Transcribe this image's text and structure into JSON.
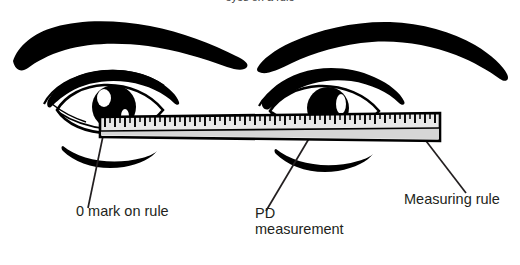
{
  "diagram": {
    "title_clipped": "eyes on a rule",
    "background_color": "#ffffff",
    "ink_color": "#000000",
    "text_color": "#231f20",
    "ruler_face_color": "#e8e8e8",
    "ruler_shadow_color": "#d0d0d0"
  },
  "labels": {
    "zero_mark": "0 mark on rule",
    "pd_line1": "PD",
    "pd_line2": "measurement",
    "measuring_rule": "Measuring rule"
  },
  "parts": {
    "left_eyebrow": "left-eyebrow",
    "right_eyebrow": "right-eyebrow",
    "left_eye": "left-eye",
    "right_eye": "right-eye",
    "left_iris": "left-iris",
    "right_iris": "right-iris",
    "ruler": "measuring-ruler",
    "tick_marks": "ruler-tick-marks"
  },
  "ruler": {
    "left_x": 100,
    "right_x": 440,
    "top_y": 115,
    "bottom_y": 139,
    "tick_count": 69,
    "tick_spacing": 5
  },
  "leaders": {
    "zero": "leader-line-zero-mark",
    "pd": "leader-line-pd",
    "rule": "leader-line-measuring-rule"
  }
}
